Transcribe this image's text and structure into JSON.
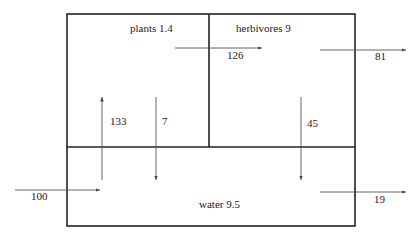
{
  "compartments": {
    "plants": {
      "label": "plants 1.4"
    },
    "herbivores": {
      "label": "herbivores 9"
    },
    "water": {
      "label": "water 9.5"
    }
  },
  "flows": {
    "input_water": "100",
    "water_to_plants": "133",
    "plants_to_water": "7",
    "plants_to_herbivores": "126",
    "herbivores_out": "81",
    "herbivores_to_water": "45",
    "water_out": "19"
  }
}
